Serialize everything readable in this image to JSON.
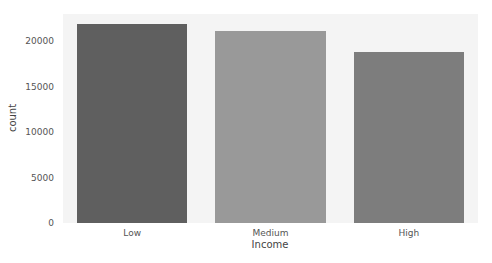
{
  "chart_data": {
    "type": "bar",
    "title": "",
    "xlabel": "Income",
    "ylabel": "count",
    "categories": [
      "Low",
      "Medium",
      "High"
    ],
    "values": [
      21900,
      21100,
      18800
    ],
    "colors": [
      "#5f5f5f",
      "#999999",
      "#7d7d7d"
    ],
    "ylim": [
      0,
      23000
    ],
    "yticks": [
      0,
      5000,
      10000,
      15000,
      20000
    ],
    "ytick_labels": [
      "0",
      "5000",
      "10000",
      "15000",
      "20000"
    ],
    "grid": false,
    "legend": null,
    "background": "#f4f4f4"
  }
}
